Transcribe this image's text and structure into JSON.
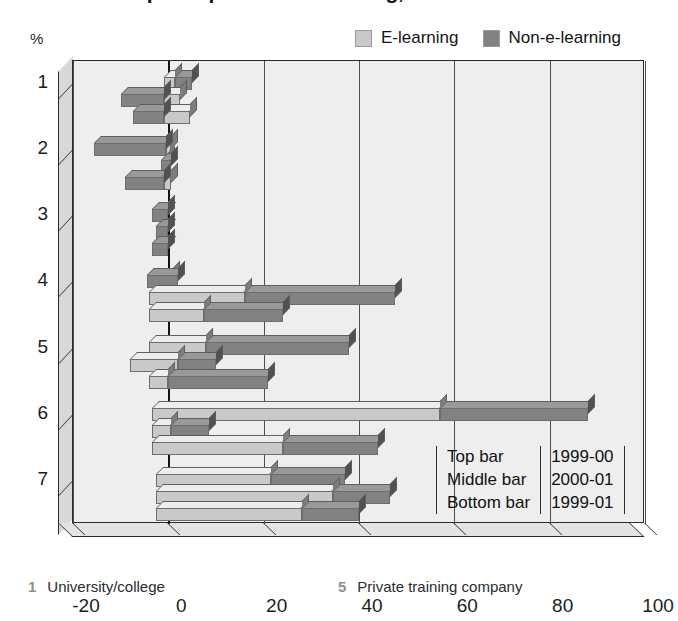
{
  "title": "Reasons for participation in e-learning, 1999-01",
  "axis": {
    "percent_symbol": "%",
    "x_ticks": [
      "-20",
      "0",
      "20",
      "40",
      "60",
      "80",
      "100"
    ],
    "x_values": [
      -20,
      0,
      20,
      40,
      60,
      80,
      100
    ],
    "y_ticks": [
      "1",
      "2",
      "3",
      "4",
      "5",
      "6",
      "7"
    ]
  },
  "legend": {
    "items": [
      {
        "label": "E-learning",
        "color": "#c9c9c9",
        "name": "e-learning"
      },
      {
        "label": "Non-e-learning",
        "color": "#828282",
        "name": "non-e-learning"
      }
    ]
  },
  "bar_key": {
    "rows": [
      {
        "position": "Top bar",
        "period": "1999-00"
      },
      {
        "position": "Middle bar",
        "period": "2000-01"
      },
      {
        "position": "Bottom bar",
        "period": "1999-01"
      }
    ]
  },
  "footnotes": [
    {
      "num": "1",
      "label": "University/college"
    },
    {
      "num": "5",
      "label": "Private training company"
    }
  ],
  "chart_data": {
    "type": "bar",
    "orientation": "horizontal",
    "stacked": true,
    "title": "Reasons for participation in e-learning, 1999-01",
    "xlabel": "%",
    "ylabel": "",
    "xlim": [
      -20,
      100
    ],
    "xticks": [
      -20,
      0,
      20,
      40,
      60,
      80,
      100
    ],
    "grid": true,
    "legend_position": "top-right",
    "categories": [
      "1",
      "2",
      "3",
      "4",
      "5",
      "6",
      "7"
    ],
    "category_labels": [
      "University/college",
      "2",
      "3",
      "4",
      "Private training company",
      "6",
      "7"
    ],
    "bar_periods": [
      "1999-00",
      "2000-01",
      "1999-01"
    ],
    "series": [
      {
        "name": "E-learning",
        "color": "#c9c9c9"
      },
      {
        "name": "Non-e-learning",
        "color": "#828282"
      }
    ],
    "groups": [
      {
        "category": "1",
        "bars": [
          {
            "period": "1999-00",
            "e_learning": [
              -1.0,
              1.5
            ],
            "non_e_learning": [
              1.5,
              5.0
            ]
          },
          {
            "period": "2000-01",
            "e_learning": [
              -1.0,
              2.5
            ],
            "non_e_learning": [
              -10.0,
              -1.0
            ]
          },
          {
            "period": "1999-01",
            "e_learning": [
              -1.0,
              4.5
            ],
            "non_e_learning": [
              -7.5,
              -1.0
            ]
          }
        ]
      },
      {
        "category": "2",
        "bars": [
          {
            "period": "1999-00",
            "e_learning": [
              -0.5,
              0.5
            ],
            "non_e_learning": [
              -15.5,
              -0.5
            ]
          },
          {
            "period": "2000-01",
            "e_learning": [
              -1.0,
              0.0
            ],
            "non_e_learning": [
              -1.5,
              0.5
            ]
          },
          {
            "period": "1999-01",
            "e_learning": [
              -1.0,
              0.5
            ],
            "non_e_learning": [
              -9.0,
              -1.0
            ]
          }
        ]
      },
      {
        "category": "3",
        "bars": [
          {
            "period": "1999-00",
            "e_learning": [
              -1.5,
              0.0
            ],
            "non_e_learning": [
              -3.5,
              0.0
            ]
          },
          {
            "period": "2000-01",
            "e_learning": [
              -1.0,
              0.0
            ],
            "non_e_learning": [
              -2.5,
              0.0
            ]
          },
          {
            "period": "1999-01",
            "e_learning": [
              -2.0,
              0.0
            ],
            "non_e_learning": [
              -3.5,
              0.0
            ]
          }
        ]
      },
      {
        "category": "4",
        "bars": [
          {
            "period": "1999-00",
            "e_learning": [
              -4.5,
              1.0
            ],
            "non_e_learning": [
              -4.5,
              2.0
            ]
          },
          {
            "period": "2000-01",
            "e_learning": [
              -4.0,
              16.0
            ],
            "non_e_learning": [
              16.0,
              47.5
            ]
          },
          {
            "period": "1999-01",
            "e_learning": [
              -4.0,
              7.5
            ],
            "non_e_learning": [
              7.5,
              24.0
            ]
          }
        ]
      },
      {
        "category": "5",
        "bars": [
          {
            "period": "1999-00",
            "e_learning": [
              -4.0,
              8.0
            ],
            "non_e_learning": [
              8.0,
              38.0
            ]
          },
          {
            "period": "2000-01",
            "e_learning": [
              -8.0,
              2.0
            ],
            "non_e_learning": [
              2.0,
              10.0
            ]
          },
          {
            "period": "1999-01",
            "e_learning": [
              -4.0,
              0.0
            ],
            "non_e_learning": [
              0.0,
              21.0
            ]
          }
        ]
      },
      {
        "category": "6",
        "bars": [
          {
            "period": "1999-00",
            "e_learning": [
              -3.5,
              57.0
            ],
            "non_e_learning": [
              57.0,
              88.0
            ]
          },
          {
            "period": "2000-01",
            "e_learning": [
              -3.5,
              0.5
            ],
            "non_e_learning": [
              0.5,
              8.5
            ]
          },
          {
            "period": "1999-01",
            "e_learning": [
              -3.5,
              24.0
            ],
            "non_e_learning": [
              24.0,
              44.0
            ]
          }
        ]
      },
      {
        "category": "7",
        "bars": [
          {
            "period": "1999-00",
            "e_learning": [
              -2.5,
              21.5
            ],
            "non_e_learning": [
              21.5,
              37.0
            ]
          },
          {
            "period": "2000-01",
            "e_learning": [
              -2.5,
              34.5
            ],
            "non_e_learning": [
              34.5,
              46.5
            ]
          },
          {
            "period": "1999-01",
            "e_learning": [
              -2.5,
              28.0
            ],
            "non_e_learning": [
              28.0,
              40.0
            ]
          }
        ]
      }
    ]
  }
}
